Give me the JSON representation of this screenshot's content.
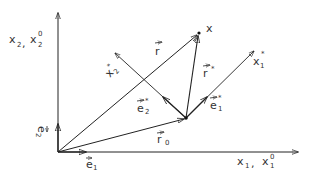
{
  "diagram": {
    "type": "coordinate-transformation-sketch",
    "colors": {
      "ink": "#222222",
      "text": "#333333",
      "background": "#ffffff"
    },
    "axes": {
      "x1_label": "x",
      "x1_sub": "1",
      "x1_sep": ",",
      "x1_0_label": "x",
      "x1_0_sub": "1",
      "x1_0_sup": "0",
      "x2_label": "x",
      "x2_sub": "2",
      "x2_sep": ",",
      "x2_0_label": "x",
      "x2_0_sub": "2",
      "x2_0_sup": "0"
    },
    "rotated_axes": {
      "x1_star_label": "x",
      "x1_star_sub": "1",
      "x1_star_sup": "*",
      "x2_star_label": "x",
      "x2_star_sub": "2",
      "x2_star_sup": "*"
    },
    "vectors": {
      "e1_label": "e",
      "e1_sub": "1",
      "e2_label": "e",
      "e2_sub": "2",
      "e1_star_label": "e",
      "e1_star_sub": "1",
      "e1_star_sup": "*",
      "e2_star_label": "e",
      "e2_star_sub": "2",
      "e2_star_sup": "*",
      "r_label": "r",
      "r0_label": "r",
      "r0_sub": "0",
      "r_star_label": "r",
      "r_star_sup": "*"
    },
    "points": {
      "x_label": "x"
    }
  }
}
